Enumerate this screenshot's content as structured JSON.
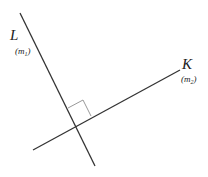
{
  "diagram": {
    "lines": [
      {
        "id": "L",
        "label": "L",
        "slope_label": "m",
        "slope_subscript": "1",
        "x1": 20,
        "y1": 13,
        "x2": 95,
        "y2": 166,
        "color": "#333333"
      },
      {
        "id": "K",
        "label": "K",
        "slope_label": "m",
        "slope_subscript": "2",
        "x1": 33,
        "y1": 150,
        "x2": 180,
        "y2": 70,
        "color": "#333333"
      }
    ],
    "right_angle_marker": {
      "color": "#999999",
      "points": "68,105 83,97 91,113 76,121"
    },
    "labels": {
      "L_text": "L",
      "L_paren_open": "(",
      "L_m": "m",
      "L_sub": "1",
      "L_paren_close": ")",
      "K_text": "K",
      "K_paren_open": "(",
      "K_m": "m",
      "K_sub": "2",
      "K_paren_close": ")"
    }
  }
}
